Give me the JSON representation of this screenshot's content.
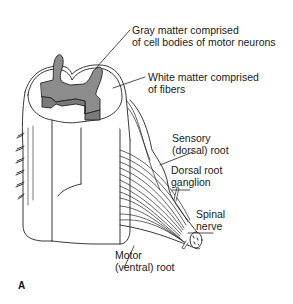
{
  "figure": {
    "panel_letter": "A",
    "colors": {
      "gray_matter": "#8c8c8c",
      "white_matter": "#ffffff",
      "outline": "#222222",
      "background": "#ffffff"
    }
  },
  "labels": {
    "gray_matter": {
      "line1": "Gray matter comprised",
      "line2": "of cell bodies of motor neurons"
    },
    "white_matter": {
      "line1": "White matter comprised",
      "line2": "of fibers"
    },
    "sensory_root": {
      "line1": "Sensory",
      "line2": "(dorsal) root"
    },
    "dorsal_root_ganglion": {
      "line1": "Dorsal root",
      "line2": "ganglion"
    },
    "spinal_nerve": {
      "line1": "Spinal",
      "line2": "nerve"
    },
    "motor_root": {
      "line1": "Motor",
      "line2": "(ventral) root"
    }
  }
}
